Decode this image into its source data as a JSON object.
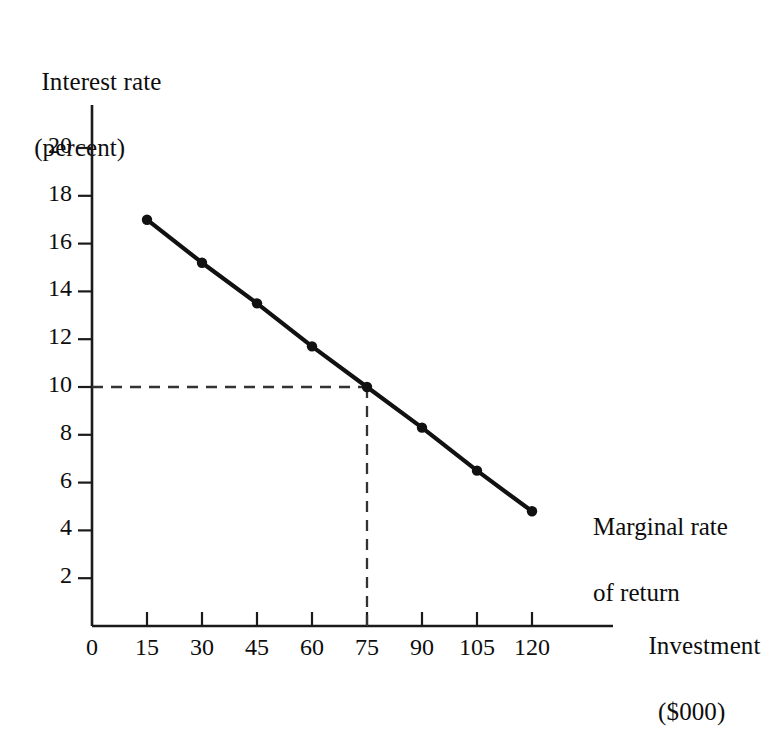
{
  "chart_data": {
    "type": "line",
    "title": "",
    "subtitle": "",
    "xlabel": "Investment",
    "xlabel_unit": "($000)",
    "ylabel": "Interest rate",
    "ylabel_unit": "(percent)",
    "x": [
      15,
      30,
      45,
      60,
      75,
      90,
      105,
      120
    ],
    "values": [
      17.0,
      15.2,
      13.5,
      11.7,
      10.0,
      8.3,
      6.5,
      4.8
    ],
    "series": [
      {
        "name": "Marginal rate of return",
        "x": [
          15,
          30,
          45,
          60,
          75,
          90,
          105,
          120
        ],
        "values": [
          17.0,
          15.2,
          13.5,
          11.7,
          10.0,
          8.3,
          6.5,
          4.8
        ]
      }
    ],
    "xlim": [
      0,
      132
    ],
    "ylim": [
      0,
      21.7
    ],
    "xticks": [
      0,
      15,
      30,
      45,
      60,
      75,
      90,
      105,
      120
    ],
    "yticks": [
      2,
      4,
      6,
      8,
      10,
      12,
      14,
      16,
      18,
      20
    ],
    "xtick_labels": [
      "0",
      "15",
      "30",
      "45",
      "60",
      "75",
      "90",
      "105",
      "120"
    ],
    "ytick_labels": [
      "2",
      "4",
      "6",
      "8",
      "10",
      "12",
      "14",
      "16",
      "18",
      "20"
    ],
    "grid": false,
    "legend": "none",
    "annotations": [
      {
        "name": "curve-label",
        "text_line1": "Marginal rate",
        "text_line2": "of return",
        "points_to_x": 120,
        "points_to_y": 4.8
      },
      {
        "name": "guide-line-horizontal",
        "style": "dashed",
        "from_x": 0,
        "from_y": 10,
        "to_x": 75,
        "to_y": 10
      },
      {
        "name": "guide-line-vertical",
        "style": "dashed",
        "from_x": 75,
        "from_y": 10,
        "to_x": 75,
        "to_y": 0
      }
    ],
    "colors": {
      "background": "#ffffff",
      "axis": "#1a1a1a",
      "curve": "#111111",
      "marker": "#111111",
      "guide": "#333333",
      "text": "#0d0d0d"
    }
  },
  "axes": {
    "y_title_line1": "Interest rate",
    "y_title_line2": "(percent)",
    "x_title_line1": "Investment",
    "x_title_line2": "($000)"
  },
  "curve": {
    "label_line1": "Marginal rate",
    "label_line2": "of return"
  }
}
